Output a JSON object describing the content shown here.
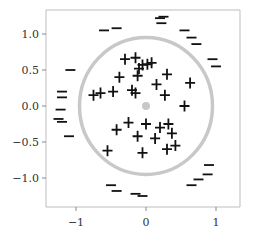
{
  "chart_data": {
    "type": "scatter",
    "title": "",
    "xlabel": "",
    "ylabel": "",
    "xlim": [
      -1.35,
      1.35
    ],
    "ylim": [
      -1.42,
      1.32
    ],
    "xticks": [
      -1,
      0,
      1
    ],
    "xtick_labels": [
      "−1",
      "0",
      "1"
    ],
    "yticks": [
      1.0,
      0.5,
      0.0,
      -0.5,
      -1.0
    ],
    "ytick_labels": [
      "1.0",
      "0.5",
      "0.0",
      "−0.5",
      "−1.0"
    ],
    "grid": false,
    "legend": null,
    "decision_boundary": {
      "shape": "circle",
      "center": [
        0.0,
        0.0
      ],
      "radius": 0.95,
      "color": "#c8c8c8"
    },
    "center_point": {
      "x": 0.0,
      "y": 0.0,
      "color": "#c8c8c8"
    },
    "series": [
      {
        "name": "positive",
        "marker": "+",
        "color": "#111111",
        "points": [
          [
            -0.3,
            0.65
          ],
          [
            -0.15,
            0.67
          ],
          [
            -0.1,
            0.52
          ],
          [
            -0.05,
            0.57
          ],
          [
            0.02,
            0.58
          ],
          [
            0.08,
            0.6
          ],
          [
            -0.38,
            0.4
          ],
          [
            -0.12,
            0.42
          ],
          [
            0.3,
            0.44
          ],
          [
            0.63,
            0.32
          ],
          [
            0.15,
            0.3
          ],
          [
            -0.47,
            0.2
          ],
          [
            -0.65,
            0.18
          ],
          [
            -0.2,
            0.22
          ],
          [
            -0.15,
            0.18
          ],
          [
            0.27,
            0.15
          ],
          [
            0.55,
            0.0
          ],
          [
            -0.42,
            -0.33
          ],
          [
            -0.25,
            -0.23
          ],
          [
            0.0,
            -0.25
          ],
          [
            0.2,
            -0.3
          ],
          [
            0.32,
            -0.25
          ],
          [
            0.37,
            -0.38
          ],
          [
            -0.55,
            -0.62
          ],
          [
            -0.12,
            -0.42
          ],
          [
            0.13,
            -0.45
          ],
          [
            0.42,
            -0.55
          ],
          [
            -0.05,
            -0.65
          ],
          [
            -0.75,
            0.15
          ],
          [
            0.3,
            -0.6
          ]
        ]
      },
      {
        "name": "negative",
        "marker": "−",
        "color": "#111111",
        "points": [
          [
            -0.6,
            1.05
          ],
          [
            -0.42,
            1.08
          ],
          [
            0.2,
            1.22
          ],
          [
            0.25,
            1.24
          ],
          [
            0.22,
            1.15
          ],
          [
            0.55,
            1.05
          ],
          [
            0.65,
            0.95
          ],
          [
            0.72,
            0.86
          ],
          [
            0.95,
            0.65
          ],
          [
            1.0,
            0.55
          ],
          [
            -1.08,
            0.5
          ],
          [
            -1.2,
            0.2
          ],
          [
            -1.2,
            0.12
          ],
          [
            -1.22,
            -0.05
          ],
          [
            -1.25,
            -0.18
          ],
          [
            -1.2,
            -0.22
          ],
          [
            -1.1,
            -0.42
          ],
          [
            -0.5,
            -1.1
          ],
          [
            -0.42,
            -1.18
          ],
          [
            -0.15,
            -1.22
          ],
          [
            -0.05,
            -1.25
          ],
          [
            0.65,
            -1.1
          ],
          [
            0.75,
            -1.02
          ],
          [
            0.9,
            -0.82
          ],
          [
            0.88,
            -0.95
          ]
        ]
      }
    ]
  }
}
